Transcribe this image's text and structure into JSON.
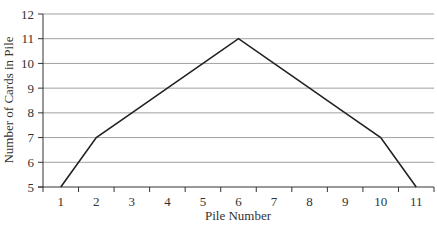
{
  "chart_data": {
    "type": "line",
    "title": "",
    "xlabel": "Pile Number",
    "ylabel": "Number of Cards in Pile",
    "categories": [
      "1",
      "2",
      "3",
      "4",
      "5",
      "6",
      "7",
      "8",
      "9",
      "10",
      "11"
    ],
    "series": [
      {
        "name": "Cards",
        "values": [
          5,
          7,
          8,
          9,
          10,
          11,
          10,
          9,
          8,
          7,
          5
        ]
      }
    ],
    "ylim": [
      5,
      12
    ],
    "yticks": [
      5,
      6,
      7,
      8,
      9,
      10,
      11,
      12
    ],
    "grid": true,
    "legend": "none",
    "colors": {
      "line": "#222222",
      "grid": "#a0a0a0",
      "axis": "#333333"
    }
  }
}
